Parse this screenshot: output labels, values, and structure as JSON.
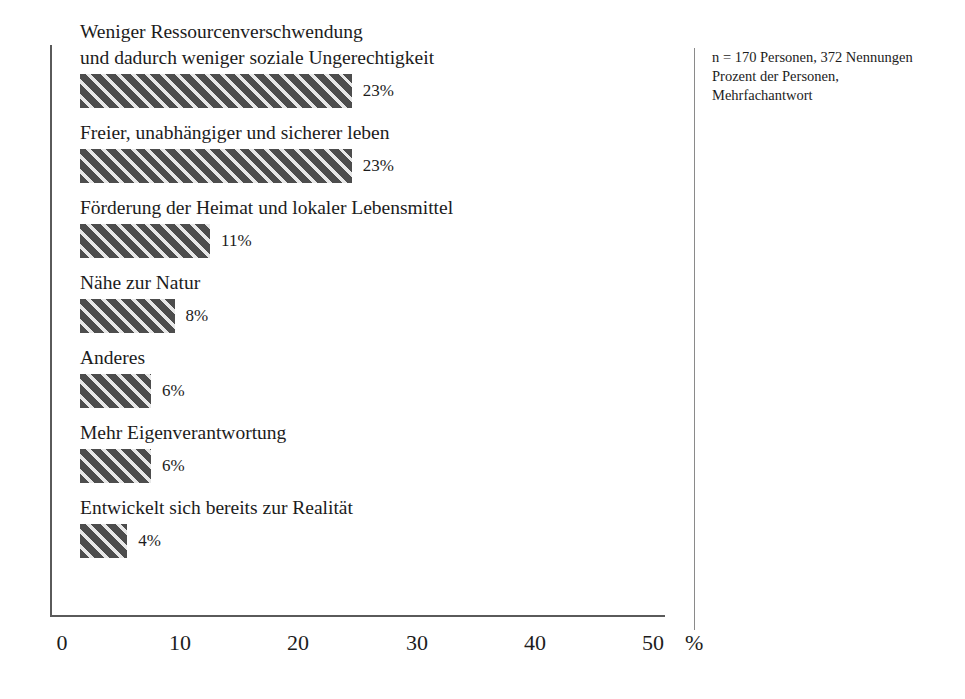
{
  "chart_data": {
    "type": "bar",
    "orientation": "horizontal",
    "title": "",
    "subtitle": "",
    "xlabel": "%",
    "ylabel": "",
    "xlim": [
      0,
      50
    ],
    "xticks": [
      0,
      10,
      20,
      30,
      40,
      50
    ],
    "xtick_labels": [
      "0",
      "10",
      "20",
      "30",
      "40",
      "50"
    ],
    "unit_label": "%",
    "grid": false,
    "legend": false,
    "categories": [
      "Weniger Ressourcenverschwendung\nund dadurch weniger soziale Ungerechtigkeit",
      "Freier, unabhängiger und sicherer leben",
      "Förderung der Heimat und lokaler Lebensmittel",
      "Nähe zur Natur",
      "Anderes",
      "Mehr Eigenverantwortung",
      "Entwickelt sich bereits zur Realität"
    ],
    "values": [
      23,
      23,
      11,
      8,
      6,
      6,
      4
    ],
    "value_labels": [
      "23%",
      "23%",
      "11%",
      "8%",
      "6%",
      "6%",
      "4%"
    ],
    "bars": [
      {
        "label_line1": "Weniger Ressourcenverschwendung",
        "label_line2": "und dadurch weniger soziale Ungerechtigkeit",
        "value": 23,
        "value_label": "23%"
      },
      {
        "label_line1": "Freier, unabhängiger und sicherer leben",
        "label_line2": "",
        "value": 23,
        "value_label": "23%"
      },
      {
        "label_line1": "Förderung der Heimat und lokaler Lebensmittel",
        "label_line2": "",
        "value": 11,
        "value_label": "11%"
      },
      {
        "label_line1": "Nähe zur Natur",
        "label_line2": "",
        "value": 8,
        "value_label": "8%"
      },
      {
        "label_line1": "Anderes",
        "label_line2": "",
        "value": 6,
        "value_label": "6%"
      },
      {
        "label_line1": "Mehr Eigenverantwortung",
        "label_line2": "",
        "value": 6,
        "value_label": "6%"
      },
      {
        "label_line1": "Entwickelt sich bereits zur Realität",
        "label_line2": "",
        "value": 4,
        "value_label": "4%"
      }
    ],
    "annotations": [
      "n = 170 Personen, 372 Nennungen",
      "Prozent der Personen,",
      "Mehrfachantwort"
    ],
    "colors": {
      "bar_fill": "#4d4d4d",
      "bar_hatch": "#e8e8e8",
      "axis": "#5a5a5a",
      "text": "#1c1c1c",
      "background": "#ffffff"
    }
  },
  "note": {
    "line1": "n = 170 Personen, 372 Nennungen",
    "line2": "Prozent der Personen,",
    "line3": "Mehrfachantwort"
  }
}
